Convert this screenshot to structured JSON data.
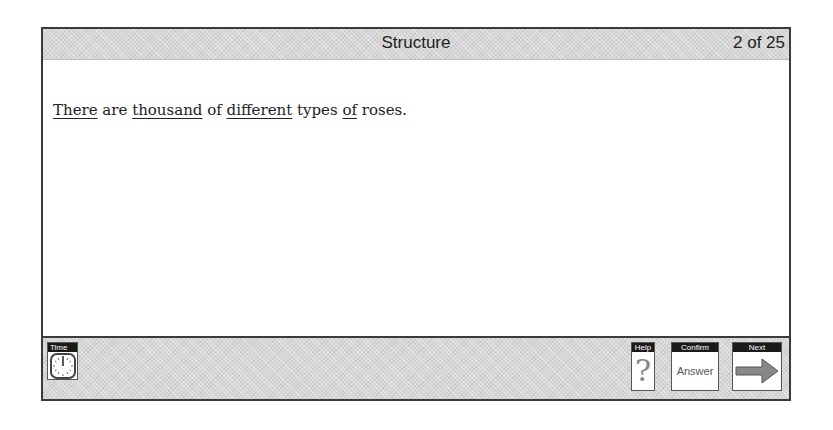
{
  "header": {
    "title": "Structure",
    "counter": "2 of 25"
  },
  "question": {
    "segments": [
      {
        "text": "There",
        "underlined": true
      },
      {
        "text": " are ",
        "underlined": false
      },
      {
        "text": "thousand",
        "underlined": true
      },
      {
        "text": " of ",
        "underlined": false
      },
      {
        "text": "different",
        "underlined": true
      },
      {
        "text": " types ",
        "underlined": false
      },
      {
        "text": "of",
        "underlined": true
      },
      {
        "text": " roses.",
        "underlined": false
      }
    ]
  },
  "footer": {
    "time": {
      "label": "Time",
      "icon": "clock-icon"
    },
    "help": {
      "label": "Help",
      "icon": "question-mark-icon",
      "glyph": "?"
    },
    "confirm": {
      "label": "Confirm",
      "text": "Answer"
    },
    "next": {
      "label": "Next",
      "icon": "right-arrow-icon"
    }
  },
  "colors": {
    "frame": "#3a3a3a",
    "bar": "#d6d6d6",
    "label_bg": "#1a1a1a",
    "arrow": "#888888"
  }
}
